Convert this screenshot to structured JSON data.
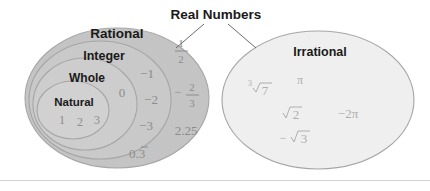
{
  "figure": {
    "callout": {
      "label": "Real Numbers"
    },
    "sets": {
      "rational": "Rational",
      "integer": "Integer",
      "whole": "Whole",
      "natural": "Natural",
      "irrational": "Irrational"
    },
    "members": {
      "natural": [
        "1",
        "2",
        "3"
      ],
      "whole_only": [
        "0"
      ],
      "integer_only": [
        "−1",
        "−2",
        "−3"
      ],
      "rational_only": [
        "1/2",
        "−2/3",
        "2.25",
        "0.3̅"
      ],
      "rational_only_parts": {
        "half_num": "1",
        "half_den": "2",
        "twothirds_sign": "−",
        "twothirds_num": "2",
        "twothirds_den": "3",
        "decimal": "2.25",
        "repeating": "0.3",
        "repeating_bar": "¯"
      },
      "irrational": [
        "∛7",
        "π",
        "√2",
        "−2π",
        "−√3"
      ],
      "irrational_parts": {
        "cube_index": "3",
        "cube_radicand": "7",
        "pi": "π",
        "sqrt2": "2",
        "neg2pi": "−2π",
        "negsqrt3_sign": "−",
        "negsqrt3": "3"
      }
    },
    "colors": {
      "rational_fill": "#c4c4c4",
      "integer_fill": "#c9c9c9",
      "whole_fill": "#cdcdcd",
      "natural_fill": "#d1d1d1",
      "irrational_fill": "#efefef",
      "ellipse_stroke": "#a6a6a6",
      "label_text": "#1a1a1a",
      "member_text": "#8c8c8c",
      "irrational_text": "#aeaeae",
      "leader_line": "#5a5a5a",
      "divider": "#d2d2d2",
      "background": "#ffffff"
    }
  }
}
